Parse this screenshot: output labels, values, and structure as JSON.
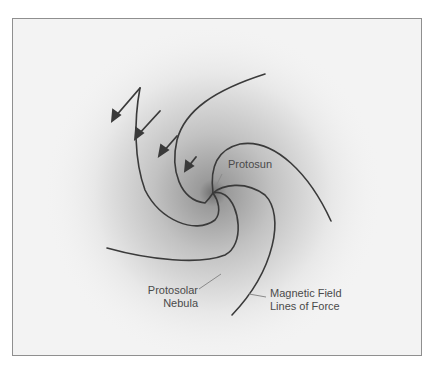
{
  "figure": {
    "type": "diagram",
    "labels": {
      "protosun": "Protosun",
      "nebula_line1": "Protosolar",
      "nebula_line2": "Nebula",
      "field_line1": "Magnetic Field",
      "field_line2": "Lines of Force"
    },
    "colors": {
      "background": "#ffffff",
      "frame_fill": "#f3f3f3",
      "frame_border": "#8f8f8f",
      "nebula_core": "#6e6e6e",
      "line": "#3a3a3a",
      "label_text": "#4a4a4a",
      "leader_line": "#8a8a8a"
    },
    "elements": {
      "field_lines_count": 4,
      "arrows_count": 4,
      "arrow_direction": "inward-down-left"
    }
  }
}
